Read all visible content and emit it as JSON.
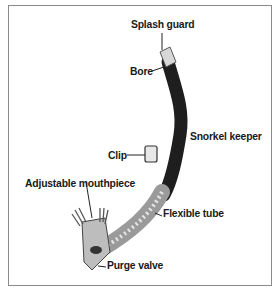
{
  "figure": {
    "subject": "snorkel",
    "labels": {
      "splash_guard": "Splash guard",
      "bore": "Bore",
      "snorkel_keeper": "Snorkel keeper",
      "clip": "Clip",
      "adjustable_mouthpiece": "Adjustable mouthpiece",
      "flexible_tube": "Flexible tube",
      "purge_valve": "Purge valve"
    },
    "colors": {
      "frame": "#8a8a8a",
      "tube": "#1e1e1e",
      "flex_tube": "#9a9a9a",
      "text": "#1a1a1a"
    }
  }
}
